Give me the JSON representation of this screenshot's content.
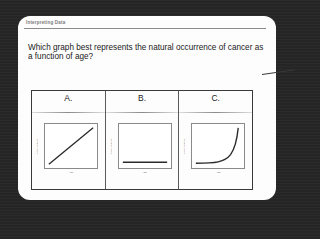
{
  "card": {
    "header": "Interpreting Data",
    "question": "Which graph best represents the natural occurrence of cancer as a function of age?"
  },
  "options": [
    {
      "label": "A.",
      "graph": "linear-increase",
      "x_axis_label": "Age",
      "y_axis_label": "Cancer Incidence"
    },
    {
      "label": "B.",
      "graph": "flat-constant",
      "x_axis_label": "Age",
      "y_axis_label": "Cancer Incidence"
    },
    {
      "label": "C.",
      "graph": "exponential-increase",
      "x_axis_label": "Age",
      "y_axis_label": "Cancer Incidence"
    }
  ],
  "colors": {
    "background": "#262626",
    "card": "#fdfdfd",
    "text": "#1a1a1a",
    "line": "#2a2a2a"
  }
}
